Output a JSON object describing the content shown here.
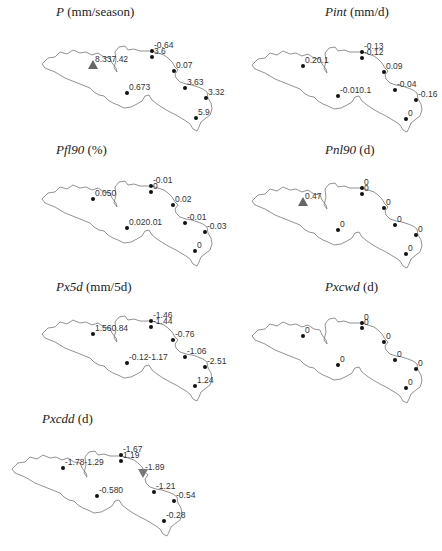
{
  "chart_data": [
    {
      "type": "map",
      "title_var": "P",
      "title_unit": "(mm/season)",
      "stations": [
        {
          "label": "8.337.42",
          "x": 93,
          "y": 65,
          "marker": "triangle-up"
        },
        {
          "label": "-0.64",
          "x": 152,
          "y": 51,
          "marker": "dot"
        },
        {
          "label": "3.6",
          "x": 152,
          "y": 57,
          "marker": "dot"
        },
        {
          "label": "0.07",
          "x": 174,
          "y": 71,
          "marker": "dot"
        },
        {
          "label": "3.63",
          "x": 185,
          "y": 88,
          "marker": "dot"
        },
        {
          "label": "3.32",
          "x": 206,
          "y": 98,
          "marker": "dot"
        },
        {
          "label": "5.9",
          "x": 196,
          "y": 118,
          "marker": "dot"
        },
        {
          "label": "0.673",
          "x": 127,
          "y": 93,
          "marker": "dot"
        }
      ]
    },
    {
      "type": "map",
      "title_var": "Pint",
      "title_unit": "(mm/d)",
      "stations": [
        {
          "label": "0.20.1",
          "x": 82,
          "y": 66,
          "marker": "dot"
        },
        {
          "label": "-0.13",
          "x": 141,
          "y": 52,
          "marker": "dot"
        },
        {
          "label": "-0.12",
          "x": 141,
          "y": 58,
          "marker": "dot"
        },
        {
          "label": "0.09",
          "x": 163,
          "y": 72,
          "marker": "dot"
        },
        {
          "label": "-0.04",
          "x": 174,
          "y": 90,
          "marker": "dot"
        },
        {
          "label": "-0.16",
          "x": 195,
          "y": 100,
          "marker": "dot"
        },
        {
          "label": "0",
          "x": 185,
          "y": 119,
          "marker": "dot"
        },
        {
          "label": "-0.010.1",
          "x": 117,
          "y": 96,
          "marker": "dot"
        }
      ]
    },
    {
      "type": "map",
      "title_var": "Pfl90",
      "title_unit": "(%)",
      "stations": [
        {
          "label": "0.050",
          "x": 93,
          "y": 59,
          "marker": "dot"
        },
        {
          "label": "-0.01",
          "x": 151,
          "y": 46,
          "marker": "dot"
        },
        {
          "label": "0",
          "x": 151,
          "y": 52,
          "marker": "dot"
        },
        {
          "label": "0.02",
          "x": 173,
          "y": 65,
          "marker": "dot"
        },
        {
          "label": "-0.01",
          "x": 185,
          "y": 83,
          "marker": "dot"
        },
        {
          "label": "-0.03",
          "x": 205,
          "y": 92,
          "marker": "dot"
        },
        {
          "label": "0",
          "x": 195,
          "y": 111,
          "marker": "dot"
        },
        {
          "label": "0.020.01",
          "x": 127,
          "y": 88,
          "marker": "dot"
        }
      ]
    },
    {
      "type": "map",
      "title_var": "Pnl90",
      "title_unit": "(d)",
      "stations": [
        {
          "label": "0.47",
          "x": 82,
          "y": 62,
          "marker": "triangle-up"
        },
        {
          "label": "0",
          "x": 141,
          "y": 48,
          "marker": "dot"
        },
        {
          "label": "0",
          "x": 141,
          "y": 54,
          "marker": "dot"
        },
        {
          "label": "0",
          "x": 163,
          "y": 68,
          "marker": "dot"
        },
        {
          "label": "0",
          "x": 174,
          "y": 85,
          "marker": "dot"
        },
        {
          "label": "0",
          "x": 195,
          "y": 95,
          "marker": "dot"
        },
        {
          "label": "0",
          "x": 185,
          "y": 114,
          "marker": "dot"
        },
        {
          "label": "0",
          "x": 117,
          "y": 90,
          "marker": "dot"
        }
      ]
    },
    {
      "type": "map",
      "title_var": "Px5d",
      "title_unit": "(mm/5d)",
      "stations": [
        {
          "label": "1.560.84",
          "x": 93,
          "y": 59,
          "marker": "dot"
        },
        {
          "label": "-1.46",
          "x": 151,
          "y": 46,
          "marker": "dot"
        },
        {
          "label": "-1.44",
          "x": 151,
          "y": 52,
          "marker": "dot"
        },
        {
          "label": "-0.76",
          "x": 173,
          "y": 65,
          "marker": "dot"
        },
        {
          "label": "-1.06",
          "x": 185,
          "y": 82,
          "marker": "dot"
        },
        {
          "label": "-2.51",
          "x": 205,
          "y": 92,
          "marker": "dot"
        },
        {
          "label": "1.24",
          "x": 195,
          "y": 111,
          "marker": "dot"
        },
        {
          "label": "-0.12-1.17",
          "x": 127,
          "y": 88,
          "marker": "dot"
        }
      ]
    },
    {
      "type": "map",
      "title_var": "Pxcwd",
      "title_unit": "(d)",
      "stations": [
        {
          "label": "0",
          "x": 82,
          "y": 61,
          "marker": "dot"
        },
        {
          "label": "0",
          "x": 141,
          "y": 48,
          "marker": "dot"
        },
        {
          "label": "0",
          "x": 141,
          "y": 53,
          "marker": "dot"
        },
        {
          "label": "0",
          "x": 163,
          "y": 67,
          "marker": "dot"
        },
        {
          "label": "0",
          "x": 174,
          "y": 85,
          "marker": "dot"
        },
        {
          "label": "0",
          "x": 195,
          "y": 94,
          "marker": "dot"
        },
        {
          "label": "0",
          "x": 185,
          "y": 113,
          "marker": "dot"
        },
        {
          "label": "0",
          "x": 117,
          "y": 90,
          "marker": "dot"
        }
      ]
    },
    {
      "type": "map",
      "title_var": "Pxcdd",
      "title_unit": "(d)",
      "stations": [
        {
          "label": "-1.78-1.29",
          "x": 63,
          "y": 63,
          "marker": "dot"
        },
        {
          "label": "-1.67",
          "x": 121,
          "y": 50,
          "marker": "dot"
        },
        {
          "label": "1.19",
          "x": 121,
          "y": 56,
          "marker": "dot"
        },
        {
          "label": "-1.89",
          "x": 143,
          "y": 68,
          "marker": "triangle-down"
        },
        {
          "label": "-1.21",
          "x": 154,
          "y": 87,
          "marker": "dot"
        },
        {
          "label": "-0.54",
          "x": 174,
          "y": 96,
          "marker": "dot"
        },
        {
          "label": "-0.28",
          "x": 164,
          "y": 116,
          "marker": "dot"
        },
        {
          "label": "-0.580",
          "x": 97,
          "y": 91,
          "marker": "dot"
        }
      ]
    }
  ]
}
